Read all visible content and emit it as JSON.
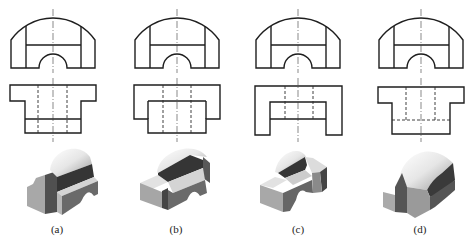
{
  "figure": {
    "panels": [
      {
        "label": "(a)",
        "top_view": "flanged T shape with solid transverse line",
        "front_view": "arched profile with semicircular notch"
      },
      {
        "label": "(b)",
        "top_view": "overlapping rectangles",
        "front_view": "arched profile with semicircular notch"
      },
      {
        "label": "(c)",
        "top_view": "U shape with inner notch",
        "front_view": "arched profile with semicircular notch"
      },
      {
        "label": "(d)",
        "top_view": "flanged T shape with hidden transverse line",
        "front_view": "arched profile with semicircular notch"
      }
    ],
    "colors": {
      "line": "#1e1e1e",
      "dark_face": "#353535",
      "mid_face": "#6a6a6a",
      "light_face": "#a8a8a8",
      "top_face": "#d4d4d4"
    }
  }
}
